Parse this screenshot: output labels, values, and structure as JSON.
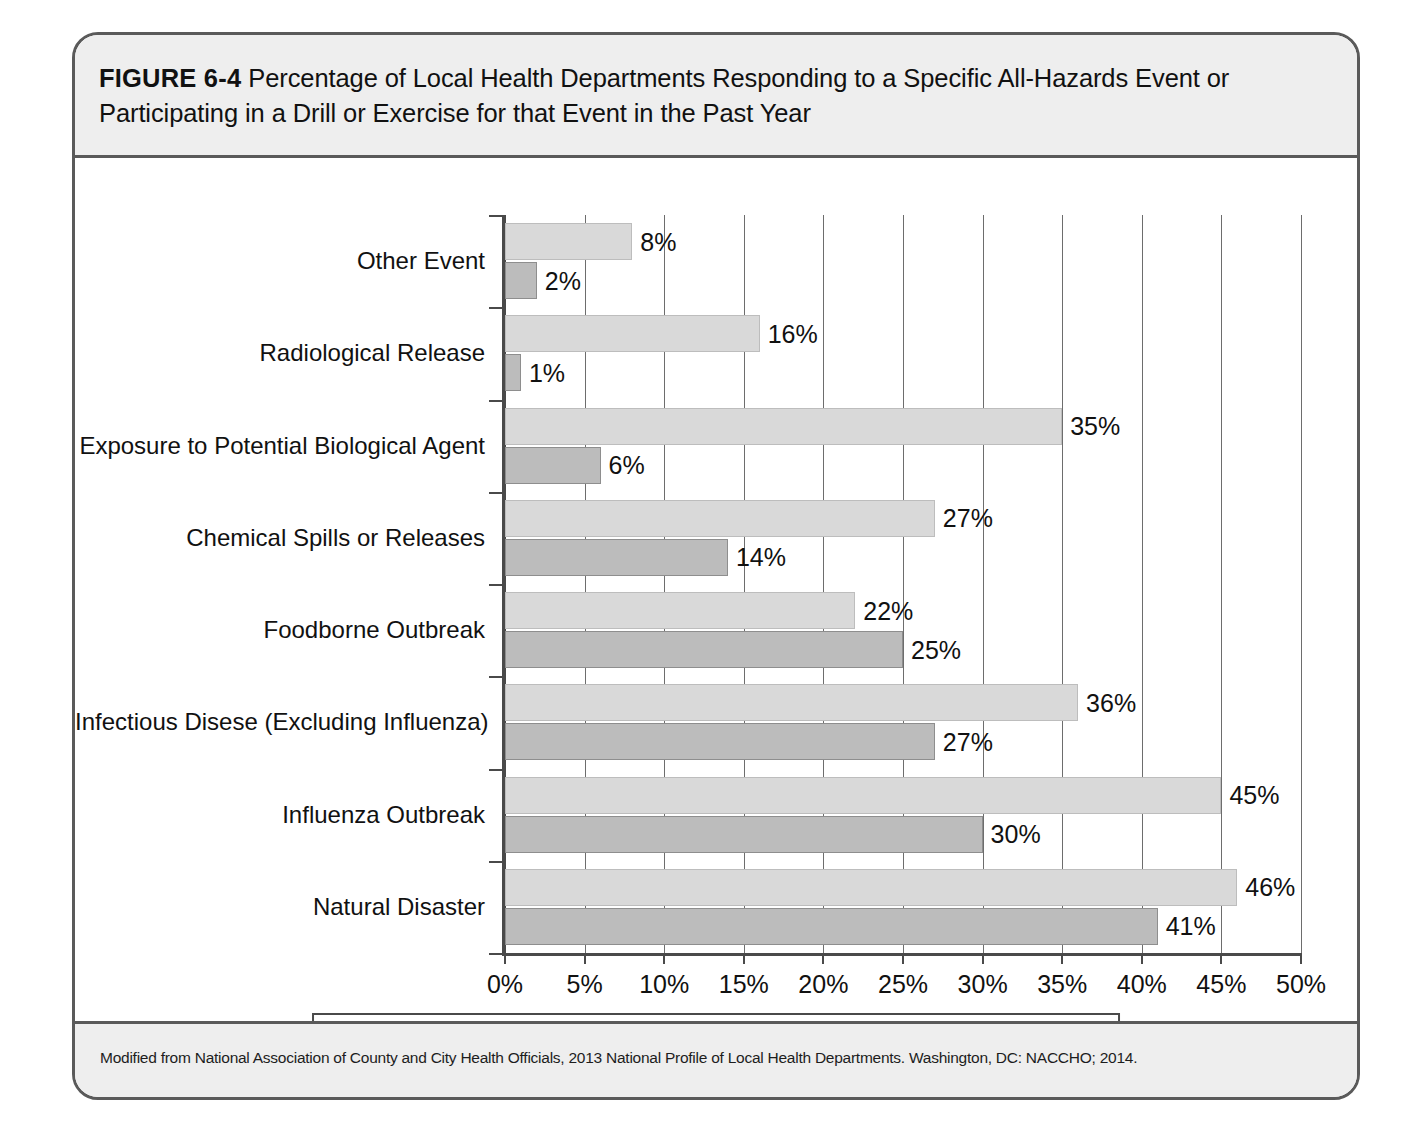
{
  "figure": {
    "label": "FIGURE 6-4",
    "caption": "Percentage of Local Health Departments Responding to a Specific All-Hazards Event or Participating in a Drill or Exercise for that Event in the Past Year",
    "source": "Modified from National Association of County and City Health Officials, 2013 National Profile of Local Health Departments. Washington, DC: NACCHO; 2014."
  },
  "chart_data": {
    "type": "bar",
    "orientation": "horizontal",
    "title": "Percentage of Local Health Departments Responding to a Specific All-Hazards Event or Participating in a Drill or Exercise for that Event in the Past Year",
    "xlabel": "",
    "ylabel": "",
    "xlim": [
      0,
      50
    ],
    "xtick_labels": [
      "0%",
      "5%",
      "10%",
      "15%",
      "20%",
      "25%",
      "30%",
      "35%",
      "40%",
      "45%",
      "50%"
    ],
    "xtick_values": [
      0,
      5,
      10,
      15,
      20,
      25,
      30,
      35,
      40,
      45,
      50
    ],
    "grid": "vertical",
    "legend_position": "bottom-center",
    "categories": [
      "Other Event",
      "Radiological Release",
      "Exposure to Potential Biological Agent",
      "Chemical Spills or Releases",
      "Foodborne Outbreak",
      "Infectious Disese (Excluding Influenza)",
      "Influenza Outbreak",
      "Natural Disaster"
    ],
    "series": [
      {
        "name": "Participated in Drill or Exercise for Event",
        "color": "#d9d9d9",
        "values": [
          8,
          16,
          35,
          27,
          22,
          36,
          45,
          46
        ],
        "labels": [
          "8%",
          "16%",
          "35%",
          "27%",
          "22%",
          "36%",
          "45%",
          "46%"
        ]
      },
      {
        "name": "Responded to Event",
        "color": "#bcbcbc",
        "values": [
          2,
          1,
          6,
          14,
          25,
          27,
          30,
          41
        ],
        "labels": [
          "2%",
          "1%",
          "6%",
          "14%",
          "25%",
          "27%",
          "30%",
          "41%"
        ]
      }
    ]
  }
}
